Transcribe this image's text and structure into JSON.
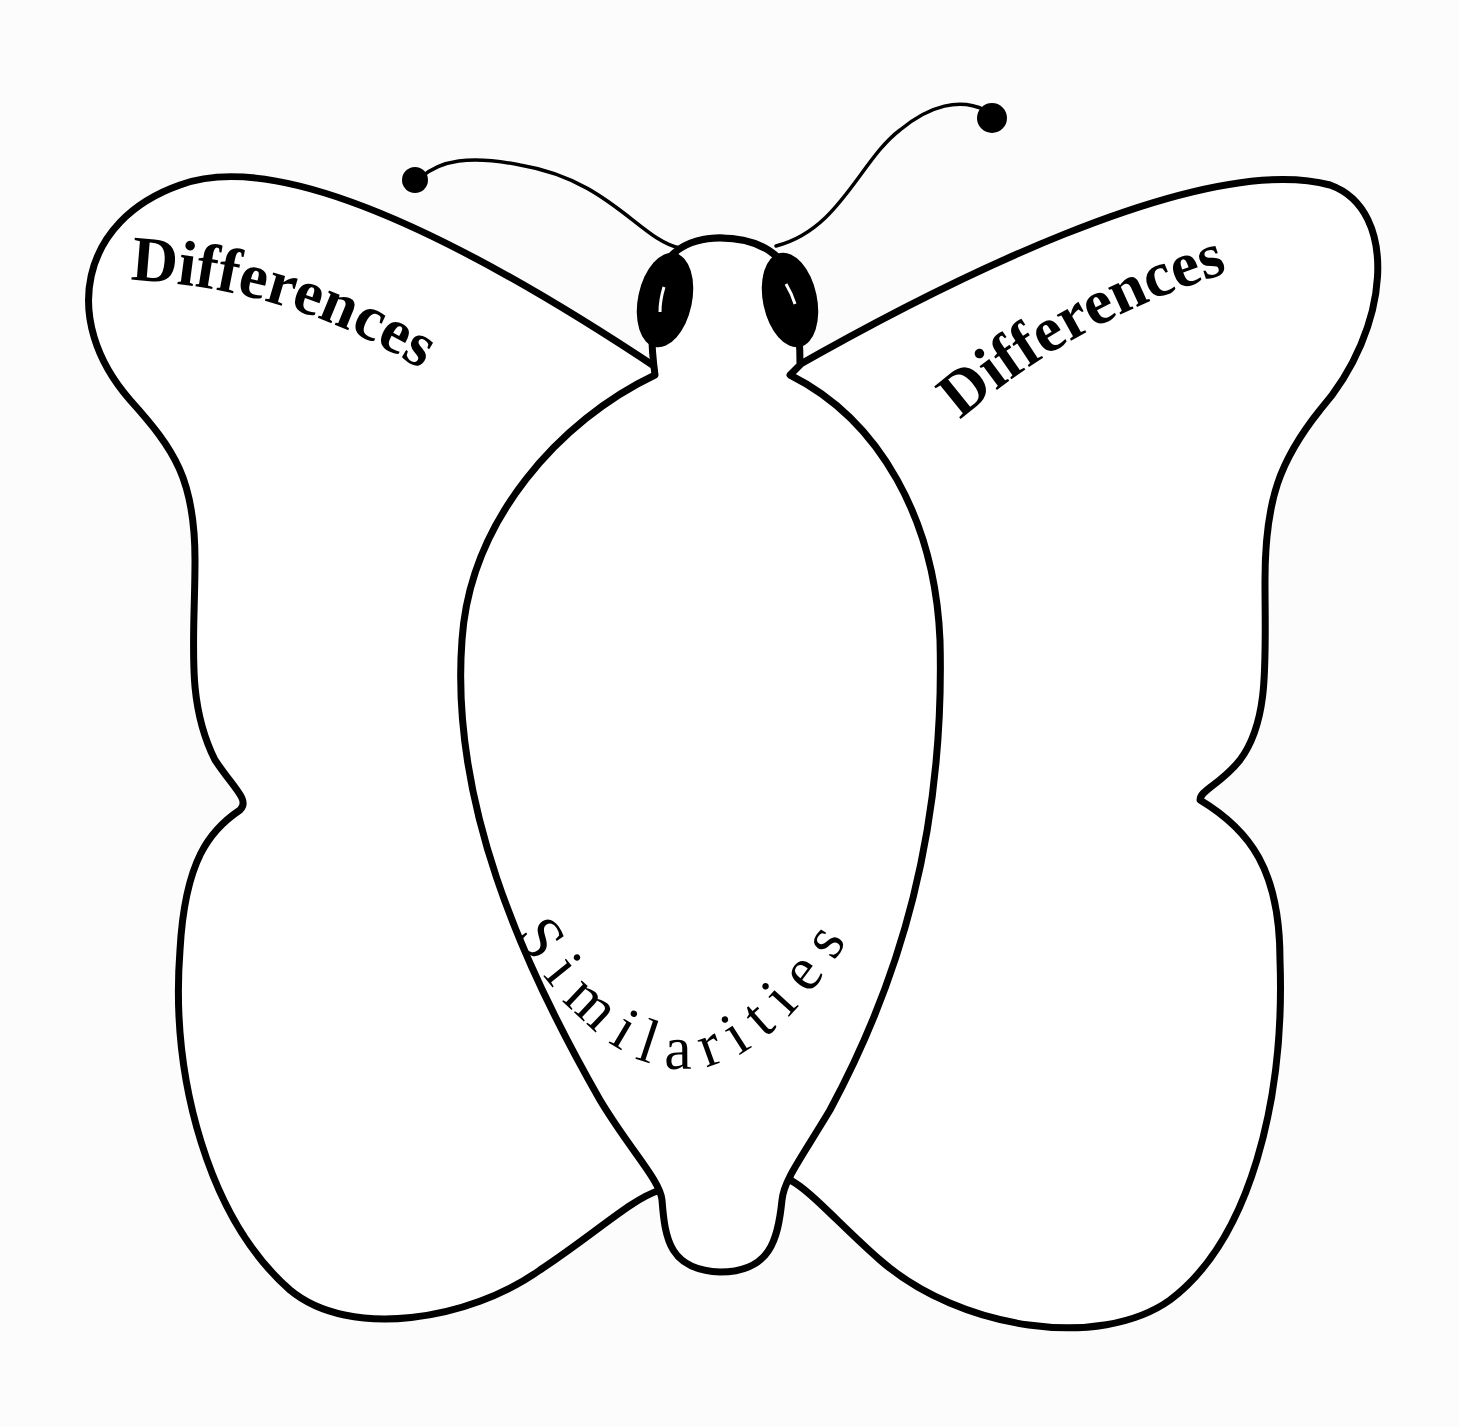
{
  "diagram": {
    "type": "butterfly-graphic-organizer",
    "left_wing": {
      "label": "Differences"
    },
    "right_wing": {
      "label": "Differences"
    },
    "body": {
      "label": "Similarities"
    },
    "colors": {
      "stroke": "#000000",
      "fill": "#ffffff",
      "background": "#fcfcfc"
    }
  }
}
